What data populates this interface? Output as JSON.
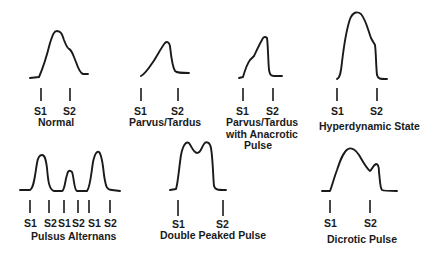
{
  "diagram": {
    "type": "arterial pulse waveforms",
    "panels": [
      {
        "id": "normal",
        "title": "Normal",
        "markers": [
          "S1",
          "S2"
        ]
      },
      {
        "id": "parvus-tardus",
        "title": "Parvus/Tardus",
        "markers": [
          "S1",
          "S2"
        ]
      },
      {
        "id": "parvus-tardus-anacrotic",
        "title_lines": [
          "Parvus/Tardus",
          "with Anacrotic",
          "Pulse"
        ],
        "markers": [
          "S1",
          "S2"
        ]
      },
      {
        "id": "hyperdynamic",
        "title": "Hyperdynamic State",
        "markers": [
          "S1",
          "S2"
        ]
      },
      {
        "id": "pulsus-alternans",
        "title": "Pulsus Alternans",
        "markers": [
          "S1",
          "S2",
          "S1",
          "S2",
          "S1",
          "S2"
        ]
      },
      {
        "id": "double-peaked",
        "title": "Double Peaked Pulse",
        "markers": [
          "S1",
          "S2"
        ]
      },
      {
        "id": "dicrotic",
        "title": "Dicrotic Pulse",
        "markers": [
          "S1",
          "S2"
        ]
      }
    ]
  },
  "colors": {
    "stroke": "#1a1a1a",
    "background": "#ffffff"
  }
}
